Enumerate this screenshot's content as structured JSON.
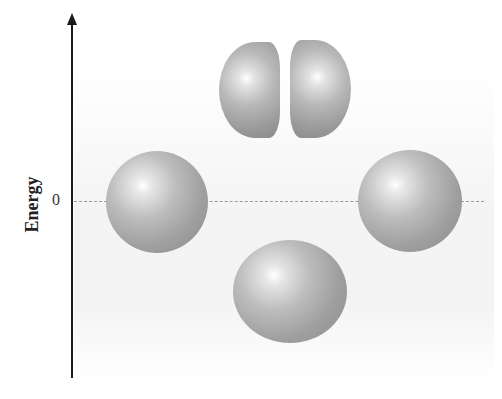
{
  "figure": {
    "axis_label": "Energy",
    "zero_tick_label": "0",
    "zero_line_style": "dashed",
    "orbitals": [
      {
        "id": "top",
        "shape": "two-lobed",
        "energy": "above zero"
      },
      {
        "id": "left",
        "shape": "sphere",
        "energy": "zero"
      },
      {
        "id": "right",
        "shape": "sphere",
        "energy": "zero"
      },
      {
        "id": "bottom",
        "shape": "sphere",
        "energy": "below zero"
      }
    ]
  }
}
